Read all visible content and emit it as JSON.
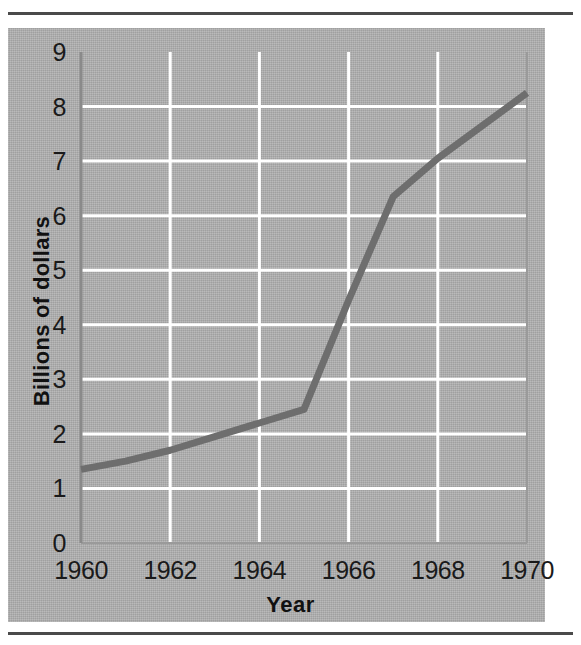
{
  "figure": {
    "background_color": "#ffffff",
    "panel_color": "#b2b2b2",
    "rule_color": "#4a4a4a",
    "gridline_color": "#ffffff",
    "axis_color": "#8a8a8a",
    "line_color": "#6e6e6e"
  },
  "chart_data": {
    "type": "line",
    "title": "",
    "subtitle": "",
    "xlabel": "Year",
    "ylabel": "Billions of dollars",
    "xlim": [
      1960,
      1970
    ],
    "ylim": [
      0,
      9
    ],
    "grid": true,
    "legend": null,
    "legend_position": "none",
    "x_tick_labels": [
      "1960",
      "1962",
      "1964",
      "1966",
      "1968",
      "1970"
    ],
    "x_ticks": [
      1960,
      1962,
      1964,
      1966,
      1968,
      1970
    ],
    "y_tick_labels": [
      "0",
      "1",
      "2",
      "3",
      "4",
      "5",
      "6",
      "7",
      "8",
      "9"
    ],
    "y_ticks": [
      0,
      1,
      2,
      3,
      4,
      5,
      6,
      7,
      8,
      9
    ],
    "x": [
      1960,
      1961,
      1962,
      1963,
      1964,
      1965,
      1966,
      1967,
      1968,
      1970
    ],
    "values": [
      1.35,
      1.5,
      1.7,
      1.95,
      2.2,
      2.45,
      4.45,
      6.35,
      7.05,
      8.25
    ],
    "series": [
      {
        "name": "Billions of dollars",
        "color": "#6e6e6e",
        "values": [
          1.35,
          1.5,
          1.7,
          1.95,
          2.2,
          2.45,
          4.45,
          6.35,
          7.05,
          8.25
        ]
      }
    ],
    "annotations": []
  }
}
